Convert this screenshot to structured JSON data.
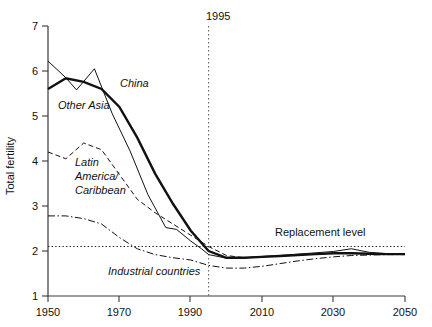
{
  "chart_data": {
    "type": "line",
    "title": "",
    "xlabel": "",
    "ylabel": "Total fertility",
    "xlim": [
      1950,
      2050
    ],
    "ylim": [
      1,
      7
    ],
    "xticks": [
      1950,
      1970,
      1990,
      2010,
      2030,
      2050
    ],
    "yticks": [
      1,
      2,
      3,
      4,
      5,
      6,
      7
    ],
    "grid": false,
    "legend_position": "inline-annotations",
    "annotations": [
      {
        "name": "year-marker",
        "label": "1995",
        "x": 1995,
        "style": "vertical dotted line"
      },
      {
        "name": "replacement-level",
        "label": "Replacement level",
        "y": 2.1,
        "style": "horizontal dotted line"
      }
    ],
    "series": [
      {
        "name": "China",
        "label": "China",
        "style": "thin-solid",
        "label_x": 1988,
        "label_y": 5.45,
        "x": [
          1950,
          1955,
          1958,
          1963,
          1968,
          1973,
          1978,
          1983,
          1986,
          1990,
          1993,
          1995,
          2000,
          2005,
          2010,
          2015,
          2020,
          2025,
          2030,
          2035,
          2040,
          2045,
          2050
        ],
        "y": [
          6.22,
          5.85,
          5.58,
          6.05,
          5.05,
          4.22,
          3.25,
          2.52,
          2.48,
          2.22,
          2.05,
          1.92,
          1.84,
          1.85,
          1.88,
          1.9,
          1.93,
          1.96,
          1.99,
          2.05,
          1.97,
          1.94,
          1.93
        ]
      },
      {
        "name": "Other Asia",
        "label": "Other Asia",
        "style": "thick-solid",
        "label_x": 1962,
        "label_y": 4.95,
        "x": [
          1950,
          1955,
          1960,
          1965,
          1970,
          1975,
          1980,
          1985,
          1990,
          1995,
          2000,
          2005,
          2010,
          2015,
          2020,
          2025,
          2030,
          2035,
          2040,
          2045,
          2050
        ],
        "y": [
          5.6,
          5.84,
          5.76,
          5.6,
          5.2,
          4.52,
          3.72,
          3.05,
          2.45,
          2.0,
          1.85,
          1.85,
          1.87,
          1.89,
          1.91,
          1.93,
          1.95,
          1.95,
          1.94,
          1.93,
          1.93
        ]
      },
      {
        "name": "Latin America/Caribbean",
        "label": "Latin America/ Caribbean",
        "style": "dashed",
        "label_x": 1957,
        "label_y": 3.78,
        "x": [
          1950,
          1955,
          1960,
          1965,
          1970,
          1975,
          1980,
          1985,
          1990,
          1995,
          2000,
          2005,
          2010,
          2015,
          2020,
          2025,
          2030,
          2035,
          2040,
          2045,
          2050
        ],
        "y": [
          4.2,
          4.05,
          4.4,
          4.25,
          3.7,
          3.15,
          2.85,
          2.6,
          2.35,
          2.1,
          1.9,
          1.85,
          1.87,
          1.89,
          1.91,
          1.93,
          1.95,
          1.95,
          1.94,
          1.93,
          1.93
        ]
      },
      {
        "name": "Industrial countries",
        "label": "Industrial countries",
        "style": "dash-dot",
        "label_x": 1976,
        "label_y": 1.62,
        "x": [
          1950,
          1955,
          1960,
          1965,
          1970,
          1975,
          1980,
          1985,
          1990,
          1995,
          2000,
          2005,
          2010,
          2015,
          2020,
          2025,
          2030,
          2035,
          2040,
          2045,
          2050
        ],
        "y": [
          2.78,
          2.78,
          2.72,
          2.6,
          2.3,
          2.05,
          1.92,
          1.85,
          1.8,
          1.68,
          1.62,
          1.62,
          1.66,
          1.72,
          1.78,
          1.83,
          1.87,
          1.9,
          1.91,
          1.92,
          1.92
        ]
      }
    ]
  },
  "axes": {
    "y_title": "Total fertility",
    "y_tick_labels": [
      "7",
      "6",
      "5",
      "4",
      "3",
      "2",
      "1"
    ],
    "x_tick_labels": [
      "1950",
      "1970",
      "1990",
      "2010",
      "2030",
      "2050"
    ]
  },
  "labels": {
    "china": "China",
    "other_asia": "Other Asia",
    "latin_line1": "Latin",
    "latin_line2": "America/",
    "latin_line3": "Caribbean",
    "industrial": "Industrial countries",
    "replacement": "Replacement level",
    "year_marker": "1995"
  },
  "colors": {
    "ink": "#111111",
    "axis": "#3a3a3a",
    "background": "#ffffff"
  }
}
